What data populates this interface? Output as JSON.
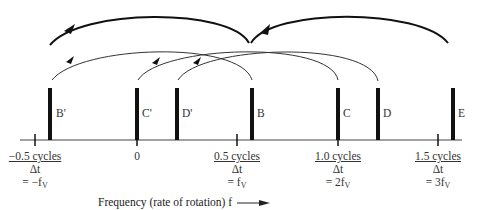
{
  "diagram": {
    "type": "frequency-aliasing-diagram",
    "axis": {
      "label": "Frequency (rate of rotation) f",
      "arrow": "right-arrow"
    },
    "ticks": [
      {
        "id": "neg05",
        "cycles": "−0.5 cycles",
        "delta": "Δt",
        "eq_prefix": "= −f",
        "sub": "V",
        "x": 35
      },
      {
        "id": "zero",
        "cycles": "0",
        "delta": "",
        "eq_prefix": "",
        "sub": "",
        "x": 137
      },
      {
        "id": "pos05",
        "cycles": "0.5 cycles",
        "delta": "Δt",
        "eq_prefix": "= f",
        "sub": "V",
        "x": 237
      },
      {
        "id": "pos10",
        "cycles": "1.0 cycles",
        "delta": "Δt",
        "eq_prefix": "= 2f",
        "sub": "V",
        "x": 338
      },
      {
        "id": "pos15",
        "cycles": "1.5 cycles",
        "delta": "Δt",
        "eq_prefix": "= 3f",
        "sub": "V",
        "x": 438
      }
    ],
    "bars": [
      {
        "label": "B'",
        "x": 50
      },
      {
        "label": "C'",
        "x": 137
      },
      {
        "label": "D'",
        "x": 177
      },
      {
        "label": "B",
        "x": 252
      },
      {
        "label": "C",
        "x": 338
      },
      {
        "label": "D",
        "x": 378
      },
      {
        "label": "E",
        "x": 453
      }
    ],
    "arcs": [
      {
        "from": "B",
        "to": "B'",
        "weight": "thin"
      },
      {
        "from": "C",
        "to": "C'",
        "weight": "thin"
      },
      {
        "from": "D",
        "to": "D'",
        "weight": "thin"
      },
      {
        "from": "B-region",
        "to": "B'-region",
        "weight": "thick"
      },
      {
        "from": "E",
        "to": "B-region",
        "weight": "thick"
      }
    ]
  }
}
